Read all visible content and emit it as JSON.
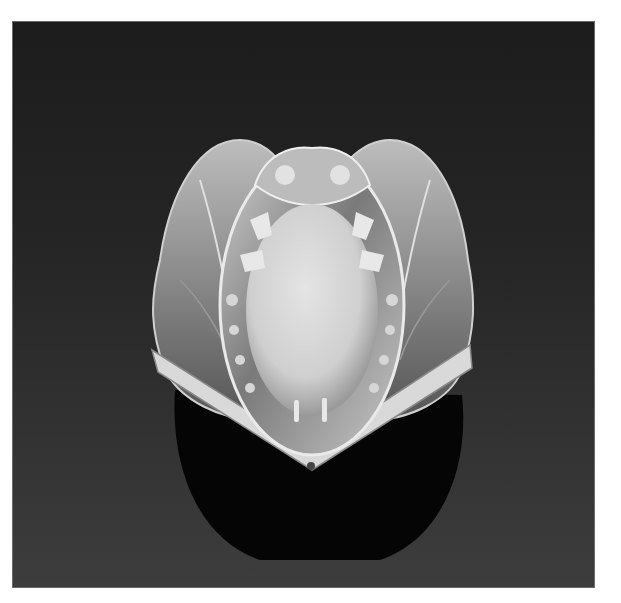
{
  "image": {
    "subject": "Art Nouveau silver ring with oval cabochon stone",
    "alt": "Black and white photograph of an ornate ring with a large oval pale cabochon framed by sculpted figures and leaf-like shoulders, on a dark background",
    "colors": {
      "border": "#ffffff",
      "background_top": "#1c1c1c",
      "background_bottom": "#3d3d3d",
      "metal_highlight": "#e6e6e6",
      "metal_mid": "#8a8a8a",
      "stone": "#d8d8d8",
      "shank": "#050505"
    }
  }
}
